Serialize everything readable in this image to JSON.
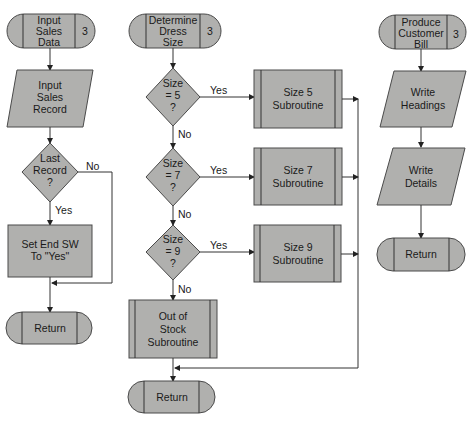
{
  "flowcharts": [
    {
      "id": "input-sales-data",
      "entry": {
        "lines": [
          "Input",
          "Sales",
          "Data"
        ],
        "number": "3"
      },
      "input": {
        "lines": [
          "Input",
          "Sales",
          "Record"
        ]
      },
      "decision": {
        "lines": [
          "Last",
          "Record",
          "?"
        ],
        "yes": "Yes",
        "no": "No"
      },
      "process": {
        "lines": [
          "Set End SW",
          "To \"Yes\""
        ]
      },
      "exit": {
        "label": "Return"
      }
    },
    {
      "id": "determine-dress-size",
      "entry": {
        "lines": [
          "Determine",
          "Dress",
          "Size"
        ],
        "number": "3"
      },
      "decisions": [
        {
          "lines": [
            "Size",
            "= 5",
            "?"
          ],
          "yes": "Yes",
          "no": "No",
          "subroutine": [
            "Size 5",
            "Subroutine"
          ]
        },
        {
          "lines": [
            "Size",
            "= 7",
            "?"
          ],
          "yes": "Yes",
          "no": "No",
          "subroutine": [
            "Size 7",
            "Subroutine"
          ]
        },
        {
          "lines": [
            "Size",
            "= 9",
            "?"
          ],
          "yes": "Yes",
          "no": "No",
          "subroutine": [
            "Size 9",
            "Subroutine"
          ]
        }
      ],
      "default_subroutine": {
        "lines": [
          "Out of",
          "Stock",
          "Subroutine"
        ]
      },
      "exit": {
        "label": "Return"
      }
    },
    {
      "id": "produce-customer-bill",
      "entry": {
        "lines": [
          "Produce",
          "Customer",
          "Bill"
        ],
        "number": "3"
      },
      "outputs": [
        {
          "lines": [
            "Write",
            "Headings"
          ]
        },
        {
          "lines": [
            "Write",
            "Details"
          ]
        }
      ],
      "exit": {
        "label": "Return"
      }
    }
  ],
  "colors": {
    "shape_fill": "#b0b0ae",
    "stroke": "#4a4a4a",
    "text": "#1a1a1a",
    "background": "#ffffff"
  }
}
